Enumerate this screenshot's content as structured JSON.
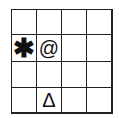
{
  "grid": {
    "rows": 4,
    "cols": 4,
    "cells": [
      [
        "",
        "",
        "",
        ""
      ],
      [
        "✱",
        "@",
        "",
        ""
      ],
      [
        "",
        "",
        "",
        ""
      ],
      [
        "",
        "Δ",
        "",
        ""
      ]
    ]
  }
}
